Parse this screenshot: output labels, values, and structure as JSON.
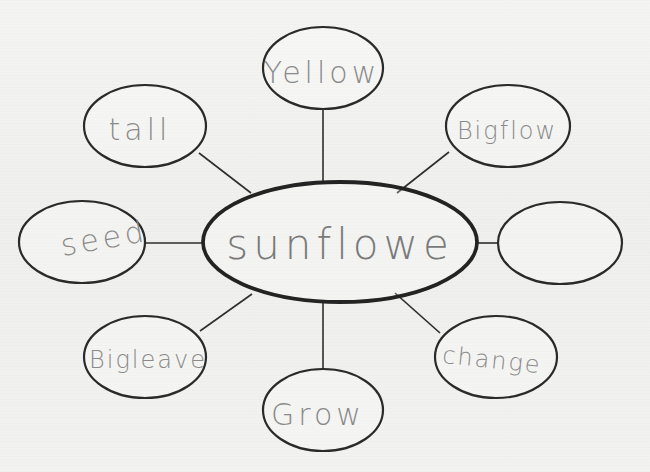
{
  "diagram": {
    "type": "concept-web",
    "center": {
      "label": "sunflowe",
      "cx": 340,
      "cy": 242,
      "rx": 137,
      "ry": 60
    },
    "nodes": [
      {
        "id": "yellow",
        "label": "Yellow",
        "cx": 323,
        "cy": 68,
        "rx": 60,
        "ry": 41,
        "line": [
          323,
          109,
          323,
          182
        ]
      },
      {
        "id": "bigflow",
        "label": "Bigflow",
        "cx": 508,
        "cy": 126,
        "rx": 62,
        "ry": 41,
        "line": [
          449,
          152,
          397,
          193
        ]
      },
      {
        "id": "tall",
        "label": "tall",
        "cx": 145,
        "cy": 126,
        "rx": 61,
        "ry": 41,
        "line": [
          199,
          153,
          251,
          193
        ]
      },
      {
        "id": "seed",
        "label": "seed",
        "cx": 82,
        "cy": 242,
        "rx": 63,
        "ry": 41,
        "line": [
          145,
          243,
          203,
          243
        ]
      },
      {
        "id": "empty",
        "label": "",
        "cx": 560,
        "cy": 243,
        "rx": 62,
        "ry": 41,
        "line": [
          477,
          243,
          498,
          243
        ]
      },
      {
        "id": "bigleave",
        "label": "Bigleave",
        "cx": 145,
        "cy": 357,
        "rx": 61,
        "ry": 41,
        "line": [
          200,
          331,
          252,
          294
        ]
      },
      {
        "id": "grow",
        "label": "Grow",
        "cx": 323,
        "cy": 410,
        "rx": 60,
        "ry": 41,
        "line": [
          323,
          303,
          323,
          369
        ]
      },
      {
        "id": "change",
        "label": "change",
        "cx": 496,
        "cy": 357,
        "rx": 61,
        "ry": 41,
        "line": [
          440,
          333,
          395,
          293
        ]
      }
    ],
    "colors": {
      "paper": "#f3f3f1",
      "ink_outline": "#2a2a2a",
      "pencil_text": "#8a8a8a"
    }
  }
}
